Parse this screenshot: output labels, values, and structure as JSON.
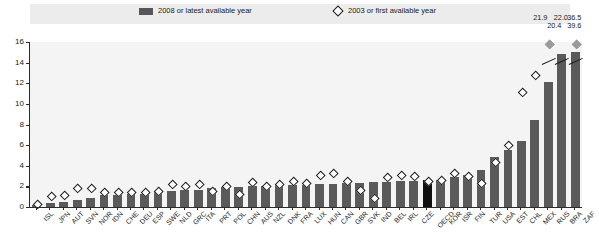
{
  "legend": {
    "bar_label": "2008 or latest available year",
    "diamond_label": "2003 or first available year",
    "bar_color": "#5a5a5a",
    "diamond_color": "#1a1a1a"
  },
  "axis": {
    "y_ticks": [
      "0",
      "2",
      "4",
      "6",
      "8",
      "10",
      "12",
      "14",
      "16"
    ],
    "y_min": 0,
    "y_max": 16,
    "highlight_color": "#101010",
    "highlight_category": "OECD"
  },
  "annotations": [
    {
      "id": "rus-2003",
      "text": "21.9"
    },
    {
      "id": "rus-2008",
      "text": "20.4"
    },
    {
      "id": "bra-2008",
      "text": "22.0"
    },
    {
      "id": "zaf-2008",
      "text": "39.6"
    },
    {
      "id": "zaf-2003",
      "text": "36.5"
    }
  ],
  "chart_data": {
    "type": "bar",
    "title": "",
    "xlabel": "",
    "ylabel": "",
    "ylim": [
      0,
      16
    ],
    "grid": false,
    "legend_position": "top",
    "categories": [
      "ISL",
      "JPN",
      "AUT",
      "SVN",
      "NOR",
      "IDN",
      "CHE",
      "DEU",
      "ESP",
      "SWE",
      "NLD",
      "GRC",
      "ITA",
      "PRT",
      "POL",
      "CHN",
      "AUS",
      "NZL",
      "DNK",
      "FRA",
      "LUX",
      "HUN",
      "CAN",
      "GBR",
      "SVK",
      "IND",
      "BEL",
      "IRL",
      "CZE",
      "OECD",
      "KOR",
      "ISR",
      "FIN",
      "TUR",
      "USA",
      "EST",
      "CHL",
      "MEX",
      "RUS",
      "BRA",
      "ZAF"
    ],
    "series": [
      {
        "name": "2008 or latest available year",
        "type": "bar",
        "values": [
          0.2,
          0.4,
          0.5,
          0.7,
          0.9,
          1.2,
          1.2,
          1.3,
          1.3,
          1.5,
          1.6,
          1.7,
          1.7,
          1.8,
          1.9,
          1.9,
          2.0,
          2.0,
          2.1,
          2.1,
          2.1,
          2.2,
          2.2,
          2.3,
          2.3,
          2.4,
          2.4,
          2.5,
          2.5,
          2.6,
          2.6,
          2.9,
          3.1,
          3.6,
          4.9,
          5.5,
          6.4,
          8.4,
          11.9,
          14.6,
          14.8
        ],
        "truncated": {
          "RUS": 20.4,
          "BRA": 22.0,
          "ZAF": 39.6
        }
      },
      {
        "name": "2003 or first available year",
        "type": "scatter-diamond",
        "values": [
          0.3,
          1.1,
          1.2,
          1.9,
          1.9,
          1.5,
          1.5,
          1.5,
          1.5,
          1.6,
          2.3,
          2.1,
          2.3,
          1.6,
          2.1,
          1.3,
          2.5,
          2.1,
          2.3,
          2.6,
          2.4,
          3.1,
          3.3,
          2.6,
          1.7,
          0.9,
          2.9,
          3.1,
          3.0,
          2.6,
          2.7,
          3.3,
          3.0,
          2.4,
          4.4,
          6.0,
          11.2,
          12.8,
          12.6,
          null,
          null
        ],
        "truncated": {
          "RUS": 21.9,
          "ZAF": 36.5
        }
      }
    ]
  }
}
